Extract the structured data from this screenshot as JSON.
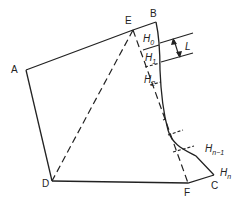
{
  "diagram": {
    "type": "geometric-section",
    "colors": {
      "line": "#222222",
      "background": "#ffffff"
    },
    "points": {
      "A": {
        "label": "A"
      },
      "B": {
        "label": "B"
      },
      "C": {
        "label": "C"
      },
      "D": {
        "label": "D"
      },
      "E": {
        "label": "E"
      },
      "F": {
        "label": "F"
      }
    },
    "heights": {
      "H0": {
        "base": "H",
        "sub": "0"
      },
      "H1": {
        "base": "H",
        "sub": "1"
      },
      "H2": {
        "base": "H",
        "sub": "2"
      },
      "Hn1": {
        "base": "H",
        "sub": "n−1"
      },
      "Hn": {
        "base": "H",
        "sub": "n"
      }
    },
    "dimension": {
      "label": "L"
    }
  }
}
